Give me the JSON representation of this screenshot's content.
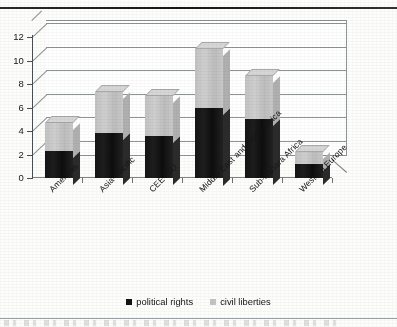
{
  "chart_data": {
    "type": "bar",
    "subtype": "stacked-column-3d",
    "title": "",
    "xlabel": "",
    "ylabel": "",
    "ylim": [
      0,
      12
    ],
    "yticks": [
      0,
      2,
      4,
      6,
      8,
      10,
      12
    ],
    "ytick_labels": [
      "0",
      "2",
      "4",
      "6",
      "8",
      "10",
      "12"
    ],
    "grid": true,
    "legend_position": "bottom-center",
    "categories": [
      "Americas",
      "Asia-Pacific",
      "CEE-fSU",
      "Middle East and North Africa",
      "Sub-Sahara Africa",
      "Western Europe"
    ],
    "series": [
      {
        "name": "political rights",
        "color": "#131313",
        "values": [
          2.3,
          3.8,
          3.6,
          6.0,
          5.0,
          1.2
        ]
      },
      {
        "name": "civil liberties",
        "color": "#c4c4c4",
        "values": [
          2.4,
          3.5,
          3.4,
          5.0,
          3.7,
          1.0
        ]
      }
    ],
    "totals": [
      4.7,
      7.3,
      7.0,
      11.0,
      8.7,
      2.2
    ]
  },
  "legend": {
    "items": [
      {
        "label": "political rights",
        "swatch": "dark-square-icon"
      },
      {
        "label": "civil liberties",
        "swatch": "light-square-icon"
      }
    ]
  }
}
